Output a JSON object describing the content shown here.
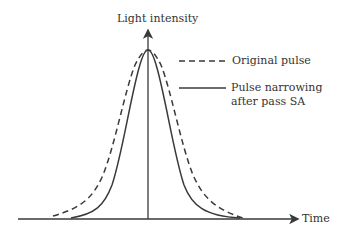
{
  "diagram": {
    "y_axis_label": "Light intensity",
    "x_axis_label": "Time",
    "legend": [
      {
        "style": "dashed",
        "label": "Original pulse"
      },
      {
        "style": "solid",
        "label_line1": "Pulse narrowing",
        "label_line2": "after pass SA"
      }
    ],
    "colors": {
      "line": "#3a3a3a",
      "text": "#333333"
    }
  }
}
